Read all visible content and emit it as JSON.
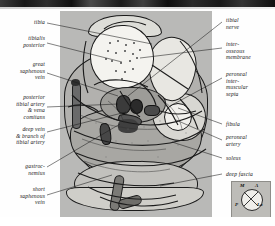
{
  "figure": {
    "type": "anatomical-cross-section",
    "region": "transverse section of the leg (calf) showing posterior compartment",
    "labels_left": [
      {
        "id": "tibia",
        "text": "tibia"
      },
      {
        "id": "tibialis-posterior",
        "text": "tibialis\nposterior"
      },
      {
        "id": "great-saphenous-vein",
        "text": "great\nsaphenous\nvein"
      },
      {
        "id": "posterior-tibial-artery",
        "text": "posterior\ntibial artery\n& vena\ncomitans"
      },
      {
        "id": "deep-vein-branch",
        "text": "deep vein\n& branch of\ntibial artery"
      },
      {
        "id": "gastrocnemius",
        "text": "gastroc-\nnemius"
      },
      {
        "id": "short-saphenous-vein",
        "text": "short\nsaphenous\nvein"
      }
    ],
    "labels_right": [
      {
        "id": "tibial-nerve",
        "text": "tibial\nnerve"
      },
      {
        "id": "interosseous-membrane",
        "text": "inter-\nosseous\nmembrane"
      },
      {
        "id": "peroneal-intermuscular-septa",
        "text": "peroneal\ninter-\nmuscular\nsepta"
      },
      {
        "id": "fibula",
        "text": "fibula"
      },
      {
        "id": "peroneal-artery",
        "text": "peroneal\nartery"
      },
      {
        "id": "soleus",
        "text": "soleus"
      },
      {
        "id": "deep-fascia",
        "text": "deep fascia"
      }
    ],
    "orientation_key": {
      "medial": "M",
      "anterior": "A",
      "posterior": "P",
      "lateral": "La"
    },
    "colors": {
      "plate_background": "#b9b9b7",
      "bone": "#f4f3ef",
      "muscle": "#b2b1ae",
      "outline": "#1a1a1a",
      "label_text": "#151515",
      "scan_strip": "#1a1a1a",
      "orientation_key_bg": "#bdbcb8"
    }
  }
}
